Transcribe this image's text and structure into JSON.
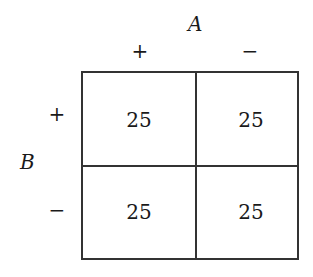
{
  "diagram": {
    "type": "2x2 contingency table",
    "column_variable": {
      "name": "A",
      "levels": [
        "+",
        "−"
      ]
    },
    "row_variable": {
      "name": "B",
      "levels": [
        "+",
        "−"
      ]
    },
    "cells": [
      [
        "25",
        "25"
      ],
      [
        "25",
        "25"
      ]
    ]
  }
}
